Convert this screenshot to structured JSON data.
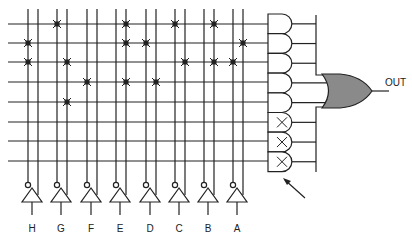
{
  "diagram": {
    "output_label": "OUT",
    "input_labels": [
      "H",
      "G",
      "F",
      "E",
      "D",
      "C",
      "B",
      "A"
    ],
    "colors": {
      "line": "#222222",
      "or_gate_fill": "#8a8a8a",
      "fuse": "#222222"
    },
    "columns_x": [
      28,
      38,
      57,
      67,
      87,
      97,
      116,
      126,
      146,
      156,
      175,
      185,
      204,
      214,
      233,
      243
    ],
    "rows_y": [
      24,
      43,
      62,
      82,
      102,
      122,
      141,
      161
    ],
    "fuses": [
      {
        "row": 0,
        "x": [
          57,
          126,
          175,
          214
        ]
      },
      {
        "row": 1,
        "x": [
          28,
          126,
          146,
          243
        ]
      },
      {
        "row": 2,
        "x": [
          28,
          67,
          185,
          214,
          233
        ]
      },
      {
        "row": 3,
        "x": [
          87,
          126,
          156
        ]
      },
      {
        "row": 4,
        "x": [
          67
        ]
      }
    ],
    "and_gates": [
      {
        "index": 0,
        "unused": false
      },
      {
        "index": 1,
        "unused": false
      },
      {
        "index": 2,
        "unused": false
      },
      {
        "index": 3,
        "unused": false
      },
      {
        "index": 4,
        "unused": false
      },
      {
        "index": 5,
        "unused": true,
        "mark": "×"
      },
      {
        "index": 6,
        "unused": true,
        "mark": "×"
      },
      {
        "index": 7,
        "unused": true,
        "mark": "×"
      }
    ],
    "arrow_annotation": "points to unused AND gates"
  }
}
